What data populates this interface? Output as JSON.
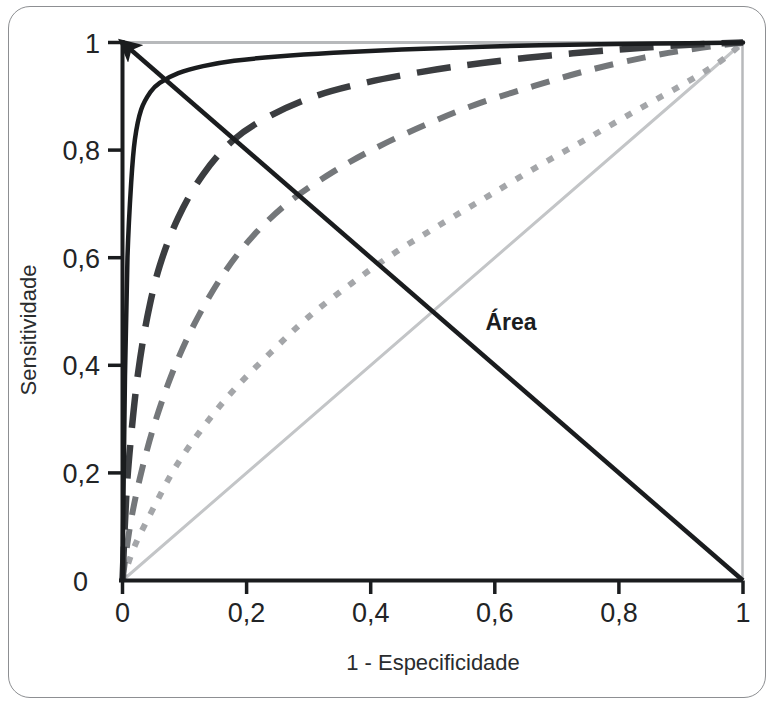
{
  "figure": {
    "name": "roc-curve-figure",
    "background_color": "#ffffff",
    "frame_color": "#8d8f92"
  },
  "chart_data": {
    "type": "line",
    "title": "",
    "subtitle": "",
    "xlabel": "1 - Especificidade",
    "ylabel": "Sensitividade",
    "xlim": [
      0,
      1
    ],
    "ylim": [
      0,
      1
    ],
    "grid": false,
    "legend_position": "none",
    "xticks": [
      0,
      0.2,
      0.4,
      0.6,
      0.8,
      1
    ],
    "yticks": [
      0,
      0.2,
      0.4,
      0.6,
      0.8,
      1
    ],
    "xtick_labels": [
      "0",
      "0,2",
      "0,4",
      "0,6",
      "0,8",
      "1"
    ],
    "ytick_labels": [
      "0",
      "0,2",
      "0,4",
      "0,6",
      "0,8",
      "1"
    ],
    "annotations": [
      {
        "text": "Área",
        "x": 0.585,
        "y": 0.48,
        "bold": true,
        "note": "label for the diagonal arrow running from (1,0) to (0,1)"
      }
    ],
    "series": [
      {
        "name": "curva-roc-excelente",
        "style": "solid",
        "color": "#1a1c1e",
        "width": 4.5,
        "auc_rank": 1,
        "x": [
          0,
          0.004,
          0.008,
          0.014,
          0.02,
          0.03,
          0.045,
          0.06,
          0.09,
          0.13,
          0.18,
          0.25,
          0.34,
          0.45,
          0.58,
          0.72,
          0.86,
          1
        ],
        "y": [
          0,
          0.38,
          0.6,
          0.74,
          0.82,
          0.875,
          0.908,
          0.925,
          0.943,
          0.956,
          0.966,
          0.974,
          0.981,
          0.987,
          0.992,
          0.996,
          0.998,
          1
        ]
      },
      {
        "name": "curva-roc-boa",
        "style": "long-dash",
        "color": "#3b3d40",
        "width": 6.5,
        "auc_rank": 2,
        "x": [
          0,
          0.006,
          0.014,
          0.025,
          0.04,
          0.06,
          0.09,
          0.13,
          0.18,
          0.24,
          0.31,
          0.39,
          0.48,
          0.58,
          0.69,
          0.8,
          0.9,
          1
        ],
        "y": [
          0,
          0.155,
          0.27,
          0.385,
          0.49,
          0.585,
          0.675,
          0.755,
          0.82,
          0.865,
          0.9,
          0.925,
          0.945,
          0.962,
          0.976,
          0.987,
          0.995,
          1
        ]
      },
      {
        "name": "curva-roc-razoavel",
        "style": "medium-dash",
        "color": "#74777a",
        "width": 6,
        "auc_rank": 3,
        "x": [
          0,
          0.012,
          0.028,
          0.05,
          0.08,
          0.115,
          0.16,
          0.21,
          0.27,
          0.34,
          0.41,
          0.49,
          0.57,
          0.66,
          0.75,
          0.84,
          0.92,
          1
        ],
        "y": [
          0,
          0.1,
          0.19,
          0.285,
          0.385,
          0.475,
          0.565,
          0.64,
          0.705,
          0.76,
          0.805,
          0.848,
          0.885,
          0.918,
          0.948,
          0.972,
          0.988,
          1
        ]
      },
      {
        "name": "curva-roc-fraca",
        "style": "dotted",
        "color": "#a4a6a9",
        "width": 6,
        "auc_rank": 4,
        "x": [
          0,
          0.02,
          0.05,
          0.085,
          0.13,
          0.18,
          0.24,
          0.3,
          0.37,
          0.44,
          0.52,
          0.59,
          0.67,
          0.75,
          0.83,
          0.9,
          0.96,
          1
        ],
        "y": [
          0,
          0.065,
          0.135,
          0.21,
          0.285,
          0.355,
          0.425,
          0.49,
          0.553,
          0.61,
          0.667,
          0.715,
          0.77,
          0.822,
          0.875,
          0.92,
          0.962,
          1
        ]
      },
      {
        "name": "linha-de-referencia-diagonal",
        "style": "solid",
        "color": "#c3c5c7",
        "width": 3,
        "auc_rank": 5,
        "x": [
          0,
          1
        ],
        "y": [
          0,
          1
        ]
      }
    ],
    "arrow": {
      "name": "area-arrow",
      "from": [
        1,
        0
      ],
      "to": [
        0,
        1
      ],
      "color": "#1a1c1e",
      "width": 4.5,
      "head": "to"
    }
  },
  "axes": {
    "x_axis_name": "x-axis",
    "y_axis_name": "y-axis",
    "x_axis_color": "#1a1c1e",
    "y_axis_color": "#1a1c1e",
    "top_spine_color": "#b7b9bb",
    "right_spine_color": "#b7b9bb"
  }
}
